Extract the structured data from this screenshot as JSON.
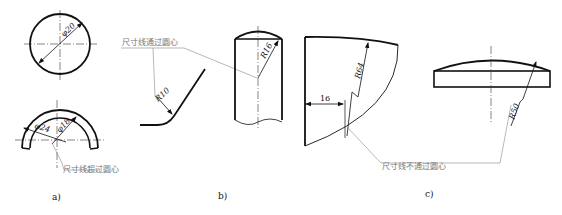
{
  "figure": {
    "panels": [
      {
        "label": "a)",
        "dimensions": [
          "φ20",
          "φ24",
          "φ18"
        ],
        "note": "尺寸线超过圆心"
      },
      {
        "label": "b)",
        "dimensions": [
          "R10",
          "R16"
        ],
        "note": "尺寸线通过圆心"
      },
      {
        "label": "c)",
        "dimensions": [
          "16",
          "R64",
          "R50"
        ],
        "note": "尺寸线不通过圆心"
      }
    ]
  },
  "colors": {
    "outline": "#111111",
    "thin": "#333333",
    "leader": "#888888",
    "note_text": "#777777"
  }
}
